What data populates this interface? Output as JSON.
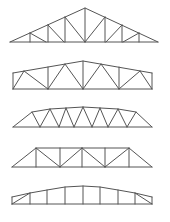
{
  "diagram": {
    "title": "",
    "background": "#ffffff",
    "stroke": "#555555",
    "stroke_width": 1,
    "trusses": [
      {
        "name": "fink-howe-pitched-truss",
        "chords": [
          [
            [
              10,
              42
            ],
            [
              85,
              8
            ],
            [
              158,
              42
            ]
          ],
          [
            [
              10,
              42
            ],
            [
              158,
              42
            ]
          ]
        ],
        "members": [
          [
            [
              30,
              33
            ],
            [
              30,
              42
            ]
          ],
          [
            [
              30,
              33
            ],
            [
              46,
              42
            ]
          ],
          [
            [
              48,
              25
            ],
            [
              48,
              42
            ]
          ],
          [
            [
              48,
              25
            ],
            [
              64,
              42
            ]
          ],
          [
            [
              65,
              17
            ],
            [
              65,
              42
            ]
          ],
          [
            [
              65,
              17
            ],
            [
              85,
              42
            ]
          ],
          [
            [
              85,
              8
            ],
            [
              85,
              42
            ]
          ],
          [
            [
              105,
              17
            ],
            [
              105,
              42
            ]
          ],
          [
            [
              105,
              17
            ],
            [
              85,
              42
            ]
          ],
          [
            [
              122,
              25
            ],
            [
              122,
              42
            ]
          ],
          [
            [
              122,
              25
            ],
            [
              106,
              42
            ]
          ],
          [
            [
              139,
              33
            ],
            [
              139,
              42
            ]
          ],
          [
            [
              139,
              33
            ],
            [
              123,
              42
            ]
          ]
        ]
      },
      {
        "name": "pratt-parallel-chord-truss",
        "chords": [
          [
            [
              13,
              73
            ],
            [
              83,
              61
            ],
            [
              152,
              73
            ]
          ],
          [
            [
              13,
              89
            ],
            [
              152,
              89
            ]
          ],
          [
            [
              13,
              73
            ],
            [
              13,
              89
            ]
          ],
          [
            [
              152,
              73
            ],
            [
              152,
              89
            ]
          ]
        ],
        "members": [
          [
            [
              13,
              89
            ],
            [
              24,
              71
            ]
          ],
          [
            [
              24,
              71
            ],
            [
              48,
              89
            ]
          ],
          [
            [
              48,
              67
            ],
            [
              48,
              89
            ]
          ],
          [
            [
              48,
              89
            ],
            [
              65,
              64
            ]
          ],
          [
            [
              65,
              64
            ],
            [
              83,
              89
            ]
          ],
          [
            [
              83,
              61
            ],
            [
              83,
              89
            ]
          ],
          [
            [
              83,
              89
            ],
            [
              101,
              64
            ]
          ],
          [
            [
              101,
              64
            ],
            [
              119,
              89
            ]
          ],
          [
            [
              119,
              67
            ],
            [
              119,
              89
            ]
          ],
          [
            [
              119,
              89
            ],
            [
              140,
              71
            ]
          ],
          [
            [
              140,
              71
            ],
            [
              152,
              89
            ]
          ]
        ]
      },
      {
        "name": "warren-bowstring-truss",
        "chords": [
          [
            [
              13,
              127
            ],
            [
              32,
              112
            ],
            [
              50,
              109
            ],
            [
              83,
              107
            ],
            [
              118,
              109
            ],
            [
              136,
              112
            ],
            [
              152,
              127
            ]
          ],
          [
            [
              13,
              127
            ],
            [
              152,
              127
            ]
          ]
        ],
        "members": [
          [
            [
              32,
              112
            ],
            [
              40,
              127
            ]
          ],
          [
            [
              40,
              127
            ],
            [
              50,
              109
            ]
          ],
          [
            [
              50,
              109
            ],
            [
              59,
              127
            ]
          ],
          [
            [
              59,
              127
            ],
            [
              66,
              108
            ]
          ],
          [
            [
              66,
              108
            ],
            [
              74,
              127
            ]
          ],
          [
            [
              74,
              127
            ],
            [
              83,
              107
            ]
          ],
          [
            [
              83,
              107
            ],
            [
              92,
              127
            ]
          ],
          [
            [
              92,
              127
            ],
            [
              100,
              108
            ]
          ],
          [
            [
              100,
              108
            ],
            [
              108,
              127
            ]
          ],
          [
            [
              108,
              127
            ],
            [
              118,
              109
            ]
          ],
          [
            [
              118,
              109
            ],
            [
              127,
              127
            ]
          ],
          [
            [
              127,
              127
            ],
            [
              136,
              112
            ]
          ]
        ]
      },
      {
        "name": "pratt-trapezoidal-truss",
        "chords": [
          [
            [
              12,
              167
            ],
            [
              36,
              148
            ],
            [
              129,
              148
            ],
            [
              152,
              167
            ]
          ],
          [
            [
              12,
              167
            ],
            [
              152,
              167
            ]
          ]
        ],
        "members": [
          [
            [
              36,
              148
            ],
            [
              36,
              167
            ]
          ],
          [
            [
              36,
              148
            ],
            [
              60,
              167
            ]
          ],
          [
            [
              60,
              148
            ],
            [
              60,
              167
            ]
          ],
          [
            [
              60,
              167
            ],
            [
              82,
              148
            ]
          ],
          [
            [
              82,
              148
            ],
            [
              82,
              167
            ]
          ],
          [
            [
              82,
              148
            ],
            [
              105,
              167
            ]
          ],
          [
            [
              105,
              148
            ],
            [
              105,
              167
            ]
          ],
          [
            [
              105,
              167
            ],
            [
              129,
              148
            ]
          ],
          [
            [
              129,
              148
            ],
            [
              129,
              167
            ]
          ]
        ]
      },
      {
        "name": "arched-vertical-web-truss",
        "chords": [
          [
            [
              12,
              197
            ],
            [
              30,
              193
            ],
            [
              47,
              190
            ],
            [
              65,
              187
            ],
            [
              83,
              186
            ],
            [
              100,
              187
            ],
            [
              118,
              190
            ],
            [
              135,
              193
            ],
            [
              152,
              197
            ]
          ],
          [
            [
              12,
              204
            ],
            [
              152,
              204
            ]
          ],
          [
            [
              12,
              197
            ],
            [
              12,
              204
            ]
          ],
          [
            [
              152,
              197
            ],
            [
              152,
              204
            ]
          ]
        ],
        "members": [
          [
            [
              12,
              204
            ],
            [
              30,
              193
            ]
          ],
          [
            [
              30,
              193
            ],
            [
              30,
              204
            ]
          ],
          [
            [
              47,
              190
            ],
            [
              47,
              204
            ]
          ],
          [
            [
              65,
              187
            ],
            [
              65,
              204
            ]
          ],
          [
            [
              83,
              186
            ],
            [
              83,
              204
            ]
          ],
          [
            [
              100,
              187
            ],
            [
              100,
              204
            ]
          ],
          [
            [
              118,
              190
            ],
            [
              118,
              204
            ]
          ],
          [
            [
              135,
              193
            ],
            [
              135,
              204
            ]
          ],
          [
            [
              135,
              193
            ],
            [
              152,
              204
            ]
          ]
        ]
      }
    ]
  }
}
